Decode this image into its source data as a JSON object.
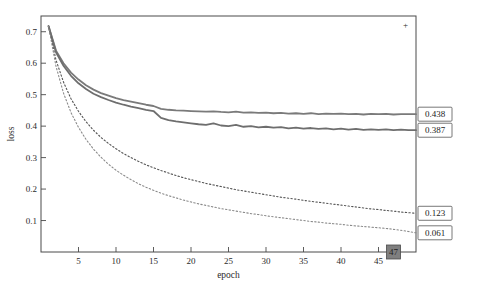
{
  "chart_data": {
    "type": "line",
    "title": "",
    "xlabel": "epoch",
    "ylabel": "loss",
    "xlim": [
      0,
      50
    ],
    "ylim": [
      0,
      0.75
    ],
    "grid": false,
    "legend": "none",
    "xticks": [
      5,
      10,
      15,
      20,
      25,
      30,
      35,
      40,
      45
    ],
    "yticks": [
      "0.1",
      "0.2",
      "0.3",
      "0.4",
      "0.5",
      "0.6",
      "0.7"
    ],
    "ytick_values": [
      0.1,
      0.2,
      0.3,
      0.4,
      0.5,
      0.6,
      0.7
    ],
    "annotations": [
      {
        "name": "series-a-final",
        "text": "0.438",
        "x": 50,
        "y": 0.438
      },
      {
        "name": "series-b-final",
        "text": "0.387",
        "x": 50,
        "y": 0.387
      },
      {
        "name": "series-c-final",
        "text": "0.123",
        "x": 50,
        "y": 0.123
      },
      {
        "name": "series-d-final",
        "text": "0.061",
        "x": 50,
        "y": 0.061
      },
      {
        "name": "x-end-marker",
        "text": "47",
        "x": 47,
        "y": 0.0
      }
    ],
    "series": [
      {
        "name": "val-loss-a",
        "style": "solid",
        "color": "#7a7a7a",
        "width": 1.8,
        "final_value": 0.438,
        "x": [
          1,
          2,
          3,
          4,
          5,
          6,
          7,
          8,
          9,
          10,
          11,
          12,
          13,
          14,
          15,
          16,
          17,
          18,
          19,
          20,
          21,
          22,
          23,
          24,
          25,
          26,
          27,
          28,
          29,
          30,
          31,
          32,
          33,
          34,
          35,
          36,
          37,
          38,
          39,
          40,
          41,
          42,
          43,
          44,
          45,
          46,
          47,
          48,
          49,
          50
        ],
        "values": [
          0.718,
          0.64,
          0.6,
          0.57,
          0.548,
          0.53,
          0.516,
          0.505,
          0.497,
          0.489,
          0.483,
          0.478,
          0.473,
          0.468,
          0.464,
          0.455,
          0.452,
          0.45,
          0.449,
          0.448,
          0.447,
          0.446,
          0.447,
          0.445,
          0.444,
          0.446,
          0.443,
          0.444,
          0.442,
          0.443,
          0.441,
          0.442,
          0.44,
          0.441,
          0.439,
          0.441,
          0.438,
          0.44,
          0.439,
          0.44,
          0.438,
          0.439,
          0.437,
          0.439,
          0.438,
          0.439,
          0.437,
          0.438,
          0.438,
          0.438
        ]
      },
      {
        "name": "val-loss-b",
        "style": "solid",
        "color": "#6e6e6e",
        "width": 1.8,
        "final_value": 0.387,
        "x": [
          1,
          2,
          3,
          4,
          5,
          6,
          7,
          8,
          9,
          10,
          11,
          12,
          13,
          14,
          15,
          16,
          17,
          18,
          19,
          20,
          21,
          22,
          23,
          24,
          25,
          26,
          27,
          28,
          29,
          30,
          31,
          32,
          33,
          34,
          35,
          36,
          37,
          38,
          39,
          40,
          41,
          42,
          43,
          44,
          45,
          46,
          47,
          48,
          49,
          50
        ],
        "values": [
          0.718,
          0.635,
          0.592,
          0.56,
          0.536,
          0.518,
          0.503,
          0.492,
          0.483,
          0.475,
          0.468,
          0.462,
          0.457,
          0.452,
          0.448,
          0.426,
          0.419,
          0.415,
          0.412,
          0.409,
          0.406,
          0.404,
          0.409,
          0.402,
          0.4,
          0.404,
          0.398,
          0.4,
          0.396,
          0.398,
          0.395,
          0.397,
          0.393,
          0.395,
          0.392,
          0.394,
          0.391,
          0.393,
          0.39,
          0.392,
          0.389,
          0.391,
          0.388,
          0.39,
          0.388,
          0.39,
          0.387,
          0.389,
          0.387,
          0.387
        ]
      },
      {
        "name": "train-loss-c",
        "style": "dotted",
        "color": "#555555",
        "width": 1.1,
        "final_value": 0.123,
        "x": [
          1,
          2,
          3,
          4,
          5,
          6,
          7,
          8,
          9,
          10,
          11,
          12,
          13,
          14,
          15,
          16,
          17,
          18,
          19,
          20,
          21,
          22,
          23,
          24,
          25,
          26,
          27,
          28,
          29,
          30,
          31,
          32,
          33,
          34,
          35,
          36,
          37,
          38,
          39,
          40,
          41,
          42,
          43,
          44,
          45,
          46,
          47,
          48,
          49,
          50
        ],
        "values": [
          0.718,
          0.61,
          0.54,
          0.487,
          0.447,
          0.414,
          0.387,
          0.364,
          0.345,
          0.328,
          0.313,
          0.3,
          0.288,
          0.277,
          0.268,
          0.259,
          0.251,
          0.243,
          0.236,
          0.23,
          0.224,
          0.218,
          0.213,
          0.208,
          0.203,
          0.198,
          0.194,
          0.19,
          0.186,
          0.182,
          0.178,
          0.174,
          0.171,
          0.168,
          0.164,
          0.161,
          0.158,
          0.155,
          0.152,
          0.149,
          0.146,
          0.143,
          0.14,
          0.137,
          0.135,
          0.132,
          0.13,
          0.127,
          0.125,
          0.123
        ]
      },
      {
        "name": "train-loss-d",
        "style": "dotted",
        "color": "#8a8a8a",
        "width": 1.1,
        "final_value": 0.061,
        "x": [
          1,
          2,
          3,
          4,
          5,
          6,
          7,
          8,
          9,
          10,
          11,
          12,
          13,
          14,
          15,
          16,
          17,
          18,
          19,
          20,
          21,
          22,
          23,
          24,
          25,
          26,
          27,
          28,
          29,
          30,
          31,
          32,
          33,
          34,
          35,
          36,
          37,
          38,
          39,
          40,
          41,
          42,
          43,
          44,
          45,
          46,
          47,
          48,
          49,
          50
        ],
        "values": [
          0.718,
          0.59,
          0.505,
          0.443,
          0.396,
          0.358,
          0.327,
          0.301,
          0.279,
          0.26,
          0.244,
          0.23,
          0.217,
          0.206,
          0.196,
          0.187,
          0.179,
          0.172,
          0.165,
          0.159,
          0.153,
          0.148,
          0.143,
          0.138,
          0.134,
          0.13,
          0.126,
          0.122,
          0.119,
          0.115,
          0.112,
          0.109,
          0.106,
          0.103,
          0.1,
          0.097,
          0.095,
          0.092,
          0.09,
          0.088,
          0.085,
          0.083,
          0.081,
          0.079,
          0.077,
          0.075,
          0.072,
          0.069,
          0.065,
          0.061
        ]
      }
    ]
  }
}
